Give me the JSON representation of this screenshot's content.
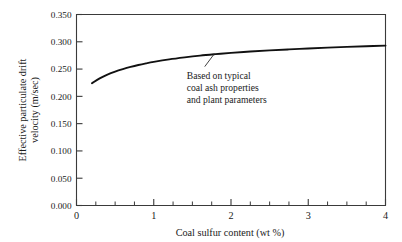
{
  "chart_data": {
    "type": "line",
    "title": "",
    "xlabel": "Coal sulfur content (wt %)",
    "ylabel_line1": "Effective particulate drift",
    "ylabel_line2": "velocity (m/sec)",
    "xlim": [
      0,
      4
    ],
    "ylim": [
      0.0,
      0.35
    ],
    "grid": false,
    "legend": null,
    "x_ticks": [
      0,
      1,
      2,
      3,
      4
    ],
    "x_tick_labels": [
      "0",
      "1",
      "2",
      "3",
      "4"
    ],
    "x_minor_step": 0.25,
    "y_ticks": [
      0.0,
      0.05,
      0.1,
      0.15,
      0.2,
      0.25,
      0.3,
      0.35
    ],
    "y_tick_labels": [
      "0.000",
      "0.050",
      "0.100",
      "0.150",
      "0.200",
      "0.250",
      "0.300",
      "0.350"
    ],
    "series": [
      {
        "name": "Effective particulate drift velocity",
        "color": "#111111",
        "x": [
          0.2,
          0.3,
          0.4,
          0.5,
          0.6,
          0.7,
          0.8,
          0.9,
          1.0,
          1.2,
          1.4,
          1.6,
          1.8,
          2.0,
          2.25,
          2.5,
          2.75,
          3.0,
          3.25,
          3.5,
          3.75,
          4.0
        ],
        "y": [
          0.224,
          0.233,
          0.24,
          0.2455,
          0.25,
          0.254,
          0.2575,
          0.2605,
          0.2632,
          0.2678,
          0.2715,
          0.2747,
          0.2773,
          0.2796,
          0.2821,
          0.2842,
          0.2861,
          0.2878,
          0.2893,
          0.2907,
          0.2919,
          0.293
        ]
      }
    ],
    "annotations": [
      {
        "name": "curve-note",
        "lines": [
          "Based on typical",
          "coal ash properties",
          "and plant parameters"
        ],
        "leader_from": [
          1.78,
          0.2772
        ],
        "leader_to": [
          1.66,
          0.2545
        ]
      }
    ]
  },
  "colors": {
    "axis": "#3a3a3a",
    "curve": "#111111",
    "text": "#1a1a1a",
    "background": "#ffffff"
  }
}
